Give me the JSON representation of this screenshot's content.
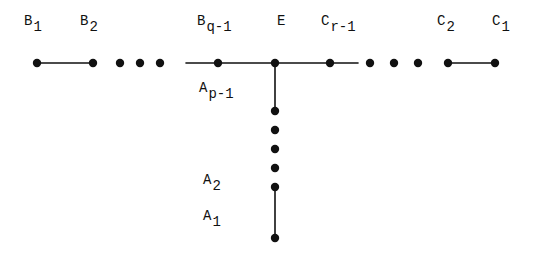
{
  "figure": {
    "width": 543,
    "height": 256,
    "background_color": "#ffffff",
    "ink_color": "#111111"
  },
  "nodes": {
    "b1": {
      "base": "B",
      "sub": "1",
      "x": 37,
      "y": 63,
      "label_x": 24,
      "label_y": 14
    },
    "b2": {
      "base": "B",
      "sub": "2",
      "x": 93,
      "y": 63,
      "label_x": 80,
      "label_y": 14
    },
    "bq1": {
      "base": "B",
      "sub": "q-1",
      "x": 218,
      "y": 63,
      "label_x": 197,
      "label_y": 14
    },
    "e": {
      "base": "E",
      "sub": "",
      "x": 275,
      "y": 63,
      "label_x": 277,
      "label_y": 14
    },
    "cr1": {
      "base": "C",
      "sub": "r-1",
      "x": 330,
      "y": 63,
      "label_x": 321,
      "label_y": 14
    },
    "c2": {
      "base": "C",
      "sub": "2",
      "x": 448,
      "y": 63,
      "label_x": 437,
      "label_y": 14
    },
    "c1": {
      "base": "C",
      "sub": "1",
      "x": 495,
      "y": 63,
      "label_x": 492,
      "label_y": 14
    },
    "ap1": {
      "base": "A",
      "sub": "p-1",
      "x": 275,
      "y": 111,
      "label_x": 199,
      "label_y": 81
    },
    "a2": {
      "base": "A",
      "sub": "2",
      "x": 275,
      "y": 187,
      "label_x": 203,
      "label_y": 173
    },
    "a1": {
      "base": "A",
      "sub": "1",
      "x": 275,
      "y": 238,
      "label_x": 203,
      "label_y": 209
    }
  },
  "edges": [
    {
      "name": "edge-b1-b2",
      "x1": 37,
      "y1": 63,
      "x2": 93,
      "y2": 63
    },
    {
      "name": "edge-bq1-e",
      "x1": 186,
      "y1": 63,
      "x2": 275,
      "y2": 63
    },
    {
      "name": "edge-e-cr1",
      "x1": 275,
      "y1": 63,
      "x2": 358,
      "y2": 63
    },
    {
      "name": "edge-c2-c1",
      "x1": 448,
      "y1": 63,
      "x2": 495,
      "y2": 63
    },
    {
      "name": "edge-e-ap1",
      "x1": 275,
      "y1": 63,
      "x2": 275,
      "y2": 111
    },
    {
      "name": "edge-a2-a1",
      "x1": 275,
      "y1": 187,
      "x2": 275,
      "y2": 238
    }
  ],
  "ellipsis_dots": {
    "left_branch": [
      {
        "x": 120,
        "y": 63
      },
      {
        "x": 140,
        "y": 63
      },
      {
        "x": 160,
        "y": 63
      }
    ],
    "right_branch": [
      {
        "x": 370,
        "y": 63
      },
      {
        "x": 394,
        "y": 63
      },
      {
        "x": 418,
        "y": 63
      }
    ],
    "bottom_branch": [
      {
        "x": 275,
        "y": 130
      },
      {
        "x": 275,
        "y": 149
      },
      {
        "x": 275,
        "y": 168
      }
    ]
  },
  "geometry": {
    "dot_radius": 4.2,
    "edge_width": 1.6
  }
}
